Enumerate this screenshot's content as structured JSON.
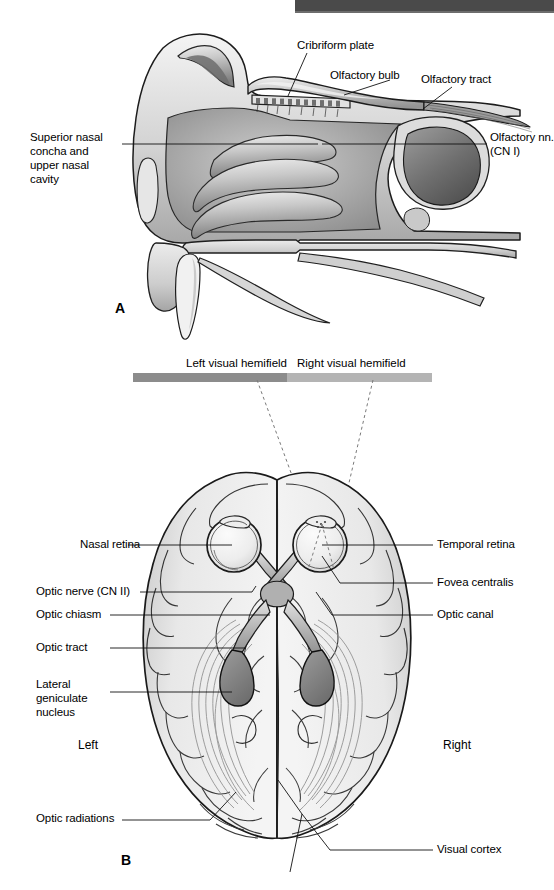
{
  "figure": {
    "panels": [
      {
        "id": "A",
        "letter": "A",
        "subject": "olfactory-nerve-sagittal-nasal-cavity",
        "labels": [
          {
            "key": "cribriform_plate",
            "text": "Cribriform plate"
          },
          {
            "key": "olfactory_bulb",
            "text": "Olfactory bulb"
          },
          {
            "key": "olfactory_tract",
            "text": "Olfactory tract"
          },
          {
            "key": "olfactory_nn_line1",
            "text": "Olfactory nn."
          },
          {
            "key": "olfactory_nn_line2",
            "text": "(CN I)"
          },
          {
            "key": "superior_nasal_l1",
            "text": "Superior nasal"
          },
          {
            "key": "superior_nasal_l2",
            "text": "concha and"
          },
          {
            "key": "superior_nasal_l3",
            "text": "upper nasal"
          },
          {
            "key": "superior_nasal_l4",
            "text": "cavity"
          }
        ]
      },
      {
        "id": "B",
        "letter": "B",
        "subject": "visual-pathway-brain-inferior-view",
        "hemifields": {
          "left_label": "Left visual hemifield",
          "right_label": "Right visual hemifield",
          "left_bar_color": "#8c8c8c",
          "right_bar_color": "#b4b4b4"
        },
        "sides": {
          "left": "Left",
          "right": "Right"
        },
        "labels": [
          {
            "key": "nasal_retina",
            "text": "Nasal retina"
          },
          {
            "key": "optic_nerve",
            "text": "Optic nerve (CN II)"
          },
          {
            "key": "optic_chiasm",
            "text": "Optic chiasm"
          },
          {
            "key": "optic_tract",
            "text": "Optic tract"
          },
          {
            "key": "lgn_l1",
            "text": "Lateral"
          },
          {
            "key": "lgn_l2",
            "text": "geniculate"
          },
          {
            "key": "lgn_l3",
            "text": "nucleus"
          },
          {
            "key": "optic_radiations",
            "text": "Optic radiations"
          },
          {
            "key": "temporal_retina",
            "text": "Temporal retina"
          },
          {
            "key": "fovea_centralis",
            "text": "Fovea centralis"
          },
          {
            "key": "optic_canal",
            "text": "Optic canal"
          },
          {
            "key": "visual_cortex",
            "text": "Visual cortex"
          }
        ]
      }
    ]
  },
  "colors": {
    "ink": "#000000",
    "page_background": "#ffffff",
    "scan_artifact_bar": "#4a4a4a",
    "tissue_light": "#e8e8e8",
    "tissue_mid": "#c4c4c4",
    "tissue_dark": "#8f8f8f",
    "lgn_fill": "#8a8a8a",
    "leader_line": "#1a1a1a"
  }
}
